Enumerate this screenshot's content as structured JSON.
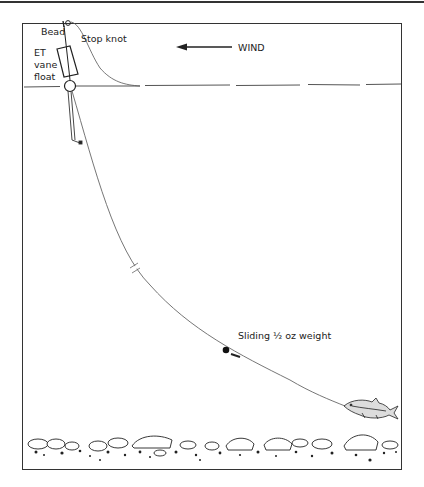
{
  "diagram": {
    "type": "fishing-rig-illustration",
    "labels": {
      "bead": "Bead",
      "stop_knot": "Stop knot",
      "float_line1": "ET",
      "float_line2": "vane",
      "float_line3": "float",
      "wind": "WIND",
      "weight": "Sliding ½ oz weight"
    },
    "components": [
      "bead",
      "stop-knot",
      "et-vane-float",
      "water-surface",
      "line",
      "line-break-mark",
      "sliding-weight",
      "swivel",
      "bait-fish",
      "river-bed-stones"
    ],
    "wind_direction": "left",
    "colors": {
      "ink": "#333333",
      "background": "#ffffff"
    }
  }
}
